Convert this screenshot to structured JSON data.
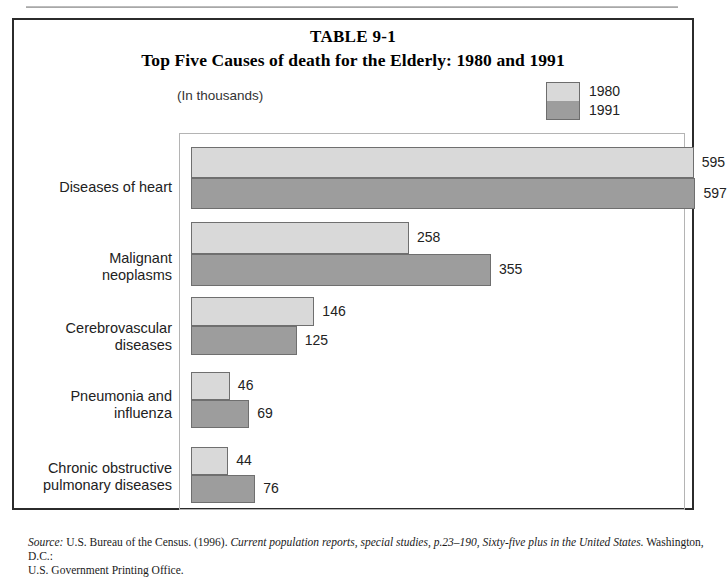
{
  "table": {
    "number": "TABLE 9-1",
    "title": "Top Five Causes of death for the Elderly: 1980 and 1991",
    "units": "(In thousands)"
  },
  "legend": {
    "items": [
      {
        "label": "1980",
        "color": "#d9d9d9"
      },
      {
        "label": "1991",
        "color": "#9d9d9d"
      }
    ]
  },
  "source": {
    "prefix": "Source:",
    "body_1": " U.S. Bureau of the Census. (1996). ",
    "italic_1": "Current population reports, special studies, p.23–190, Sixty-five plus in the United States.",
    "body_2": " Washington, D.C.:",
    "line_2": "U.S. Government Printing Office."
  },
  "chart_data": {
    "type": "bar",
    "orientation": "horizontal",
    "title": "Top Five Causes of death for the Elderly: 1980 and 1991",
    "subtitle": "(In thousands)",
    "xlabel": "",
    "ylabel": "",
    "units": "thousands",
    "grid": false,
    "legend_position": "top-right",
    "xlim": [
      0,
      620
    ],
    "categories": [
      "Diseases of heart",
      "Malignant neoplasms",
      "Cerebrovascular diseases",
      "Pneumonia and influenza",
      "Chronic obstructive pulmonary diseases"
    ],
    "series": [
      {
        "name": "1980",
        "color": "#d9d9d9",
        "values": [
          595,
          258,
          146,
          46,
          44
        ]
      },
      {
        "name": "1991",
        "color": "#9d9d9d",
        "values": [
          597,
          355,
          125,
          69,
          76
        ]
      }
    ]
  }
}
